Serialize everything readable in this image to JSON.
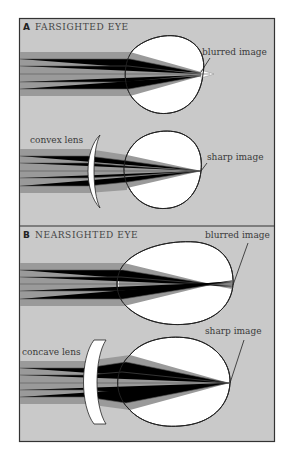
{
  "colors": {
    "panel_bg": "#c9c9c9",
    "ray_band": "#9a9a9a",
    "ray_line": "#555555",
    "eye_fill": "#ffffff",
    "outline": "#222222",
    "frame": "#333333"
  },
  "panel_a": {
    "letter": "A",
    "title": "FARSIGHTED EYE",
    "top": {
      "label": "blurred image"
    },
    "bottom": {
      "lens_label": "convex lens",
      "label": "sharp image"
    }
  },
  "panel_b": {
    "letter": "B",
    "title": "NEARSIGHTED EYE",
    "top": {
      "label": "blurred image"
    },
    "bottom": {
      "lens_label": "concave lens",
      "label": "sharp image"
    }
  }
}
